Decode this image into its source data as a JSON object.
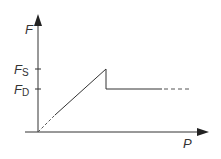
{
  "diagram": {
    "y_axis_label": "F",
    "x_axis_label": "P",
    "ticks": [
      {
        "main": "F",
        "sub": "S"
      },
      {
        "main": "F",
        "sub": "D"
      }
    ],
    "colors": {
      "line": "#333333",
      "background": "#ffffff"
    }
  }
}
